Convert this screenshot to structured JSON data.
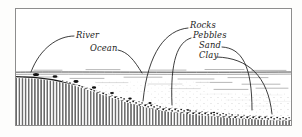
{
  "figure": {
    "name": "shoreline-sediment-deposition-cross-section",
    "style": "hand-drawn pen-and-ink cross section",
    "background_color": "#fdfdfc",
    "ink_color": "#1a1a1a",
    "frame": {
      "color": "#8d8d8d",
      "x": 15,
      "y": 8,
      "width": 277,
      "height": 118
    }
  },
  "labels": [
    {
      "id": "river",
      "text": "River",
      "x": 76,
      "y": 36
    },
    {
      "id": "ocean",
      "text": "Ocean",
      "x": 90,
      "y": 49
    },
    {
      "id": "rocks",
      "text": "Rocks",
      "x": 190,
      "y": 26
    },
    {
      "id": "pebbles",
      "text": "Pebbles",
      "x": 193,
      "y": 36
    },
    {
      "id": "sand",
      "text": "Sand",
      "x": 199,
      "y": 46
    },
    {
      "id": "clay",
      "text": "Clay",
      "x": 199,
      "y": 56
    }
  ],
  "leaders": [
    {
      "id": "river-leader",
      "for": "River",
      "path": "M74,36 C58,36 40,48 31,72"
    },
    {
      "id": "ocean-leader",
      "for": "Ocean",
      "path": "M118,50 C128,52 134,60 142,73"
    },
    {
      "id": "rocks-leader",
      "for": "Rocks",
      "path": "M188,28 C166,30 148,52 143,101"
    },
    {
      "id": "pebbles-leader",
      "for": "Pebbles",
      "path": "M191,38 C178,42 170,60 172,105"
    },
    {
      "id": "sand-leader",
      "for": "Sand",
      "path": "M222,47 C242,48 252,66 252,110"
    },
    {
      "id": "clay-leader",
      "for": "Clay",
      "path": "M217,57 C248,58 268,76 272,114"
    }
  ],
  "geology": {
    "water_surface_y": 72,
    "water_label": "ocean water surface",
    "bedrock_label": "bedrock with vertical hatching",
    "deposit_label": "coarse rock and pebble deposit",
    "shore_line_path": "M15,76 C40,76 62,79 88,88 C112,96 136,104 164,109 C200,114 240,117 292,119",
    "hatch_top_path": "M15,78 C40,78 62,81 88,90 C112,98 136,106 164,111 C200,116 240,119 292,121"
  },
  "colors": {
    "ink": "#1a1a1a",
    "frame": "#8d8d8d",
    "water": "#6b6b6b",
    "hatch": "#2a2a2a",
    "deposit": "#111111"
  }
}
